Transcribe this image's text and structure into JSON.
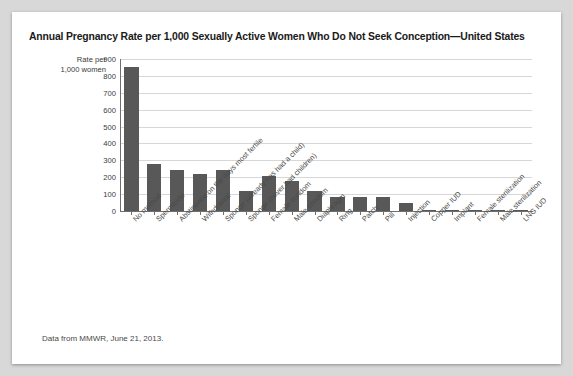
{
  "figure": {
    "title": "Annual Pregnancy Rate per 1,000 Sexually Active Women Who Do Not Seek Conception—United States",
    "source_note": "Data from MMWR, June 21, 2013.",
    "axis_title_line1": "Rate per",
    "axis_title_line2": "1,000 women",
    "bar_color": "#585858",
    "grid_color": "#d7d7d7",
    "axis_color": "#6e6e6e",
    "background": "#ffffff",
    "page_background": "#d8d8d8"
  },
  "chart_data": {
    "type": "bar",
    "title": "Annual Pregnancy Rate per 1,000 Sexually Active Women Who Do Not Seek Conception—United States",
    "xlabel": "",
    "ylabel": "Rate per 1,000 women",
    "ylim": [
      0,
      900
    ],
    "yticks": [
      0,
      100,
      200,
      300,
      400,
      500,
      600,
      700,
      800,
      900
    ],
    "ytick_labels": [
      "0",
      "100",
      "200",
      "300",
      "400",
      "500",
      "600",
      "700",
      "800",
      "900"
    ],
    "grid": true,
    "legend": false,
    "categories": [
      "No method",
      "Spermicide",
      "Abstinence on the days most fertile",
      "Withdrawal",
      "Sponge (already has had a child)",
      "Sponge (never had children)",
      "Female condom",
      "Male condom",
      "Diaphragm",
      "Ring",
      "Patch",
      "Pill",
      "Injection",
      "Copper IUD",
      "Implant",
      "Female sterilization",
      "Male sterilization",
      "LNG IUD"
    ],
    "values": [
      850,
      280,
      240,
      220,
      240,
      120,
      210,
      180,
      120,
      85,
      82,
      85,
      50,
      8,
      5,
      5,
      2,
      2
    ]
  }
}
